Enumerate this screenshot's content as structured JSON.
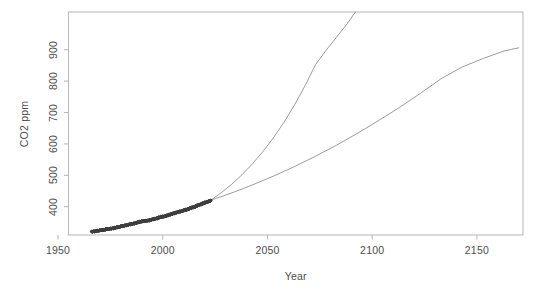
{
  "chart_data": {
    "type": "scatter",
    "title": "",
    "subtitle": "",
    "xlabel": "Year",
    "ylabel": "CO2 ppm",
    "xlim": [
      1955,
      2172
    ],
    "ylim": [
      310,
      1020
    ],
    "grid": false,
    "legend": "none",
    "background": "#ffffff",
    "frame_color": "#b9b9b9",
    "axis_text_color": "#4d4d4d",
    "point_color": "#3d3d3d",
    "line_color": "#8a8a8a",
    "xticks": [
      1950,
      2000,
      2050,
      2100,
      2150
    ],
    "xtick_labels": [
      "1950",
      "2000",
      "2050",
      "2100",
      "2150"
    ],
    "yticks": [
      400,
      500,
      600,
      700,
      800,
      900
    ],
    "ytick_labels": [
      "400",
      "500",
      "600",
      "700",
      "800",
      "900"
    ],
    "series": [
      {
        "name": "observed-co2-measurements",
        "type": "scatter",
        "marker": "open-circle",
        "x": [
          1966.0,
          1966.5,
          1967.0,
          1967.5,
          1968.0,
          1968.5,
          1969.0,
          1969.5,
          1970.0,
          1970.5,
          1971.0,
          1971.5,
          1972.0,
          1972.5,
          1973.0,
          1973.5,
          1974.0,
          1974.5,
          1975.0,
          1975.5,
          1976.0,
          1976.5,
          1977.0,
          1977.5,
          1978.0,
          1978.5,
          1979.0,
          1979.5,
          1980.0,
          1980.5,
          1981.0,
          1981.5,
          1982.0,
          1982.5,
          1983.0,
          1983.5,
          1984.0,
          1984.5,
          1985.0,
          1985.5,
          1986.0,
          1986.5,
          1987.0,
          1987.5,
          1988.0,
          1988.5,
          1989.0,
          1989.5,
          1990.0,
          1990.5,
          1991.0,
          1991.5,
          1992.0,
          1992.5,
          1993.0,
          1993.5,
          1994.0,
          1994.5,
          1995.0,
          1995.5,
          1996.0,
          1996.5,
          1997.0,
          1997.5,
          1998.0,
          1998.5,
          1999.0,
          1999.5,
          2000.0,
          2000.5,
          2001.0,
          2001.5,
          2002.0,
          2002.5,
          2003.0,
          2003.5,
          2004.0,
          2004.5,
          2005.0,
          2005.5,
          2006.0,
          2006.5,
          2007.0,
          2007.5,
          2008.0,
          2008.5,
          2009.0,
          2009.5,
          2010.0,
          2010.5,
          2011.0,
          2011.5,
          2012.0,
          2012.5,
          2013.0,
          2013.5,
          2014.0,
          2014.5,
          2015.0,
          2015.5,
          2016.0,
          2016.5,
          2017.0,
          2017.5,
          2018.0,
          2018.5,
          2019.0,
          2019.5,
          2020.0,
          2020.5,
          2021.0,
          2021.5,
          2022.0,
          2022.5,
          2023.0
        ],
        "y": [
          321.4,
          320.0,
          322.2,
          320.9,
          323.1,
          321.6,
          324.6,
          323.0,
          325.7,
          324.2,
          326.3,
          324.9,
          327.5,
          326.0,
          330.2,
          328.4,
          330.2,
          328.7,
          331.1,
          329.5,
          332.1,
          330.4,
          333.8,
          332.1,
          335.4,
          333.7,
          336.8,
          335.1,
          338.8,
          337.1,
          340.1,
          338.4,
          341.4,
          339.7,
          343.0,
          341.3,
          344.6,
          342.9,
          346.0,
          344.3,
          347.4,
          345.7,
          349.2,
          347.4,
          351.6,
          349.8,
          353.1,
          351.3,
          354.4,
          352.6,
          355.6,
          353.8,
          356.4,
          354.6,
          357.1,
          355.3,
          358.8,
          357.0,
          360.8,
          359.0,
          362.6,
          360.8,
          363.8,
          362.0,
          366.7,
          364.9,
          368.4,
          366.6,
          369.6,
          367.8,
          371.1,
          369.3,
          373.2,
          371.4,
          375.8,
          374.0,
          377.5,
          375.7,
          379.8,
          378.0,
          381.9,
          380.1,
          383.8,
          382.0,
          385.6,
          383.8,
          387.4,
          385.6,
          389.9,
          388.1,
          391.6,
          389.8,
          393.9,
          392.1,
          396.5,
          394.7,
          398.6,
          396.8,
          400.8,
          399.0,
          404.2,
          402.4,
          406.6,
          404.8,
          408.5,
          406.7,
          411.7,
          409.9,
          414.2,
          412.4,
          416.5,
          414.7,
          418.6,
          416.8,
          420.5
        ]
      },
      {
        "name": "high-emissions-projection",
        "type": "line",
        "description": "steeper exponential projection exiting top of panel near 2092",
        "x": [
          2023,
          2028,
          2033,
          2038,
          2043,
          2048,
          2053,
          2058,
          2063,
          2068,
          2073,
          2078,
          2083,
          2088,
          2092
        ],
        "y": [
          421,
          445,
          472,
          503,
          538,
          577,
          621,
          670,
          725,
          786,
          853,
          898,
          940,
          982,
          1020
        ]
      },
      {
        "name": "moderate-emissions-projection",
        "type": "line",
        "description": "shallower projection reaching about 905 ppm at 2170",
        "x": [
          2023,
          2033,
          2043,
          2053,
          2063,
          2073,
          2083,
          2093,
          2103,
          2113,
          2123,
          2133,
          2143,
          2153,
          2163,
          2170
        ],
        "y": [
          421,
          444,
          470,
          498,
          528,
          561,
          596,
          634,
          674,
          716,
          761,
          808,
          845,
          872,
          896,
          906
        ]
      }
    ]
  }
}
